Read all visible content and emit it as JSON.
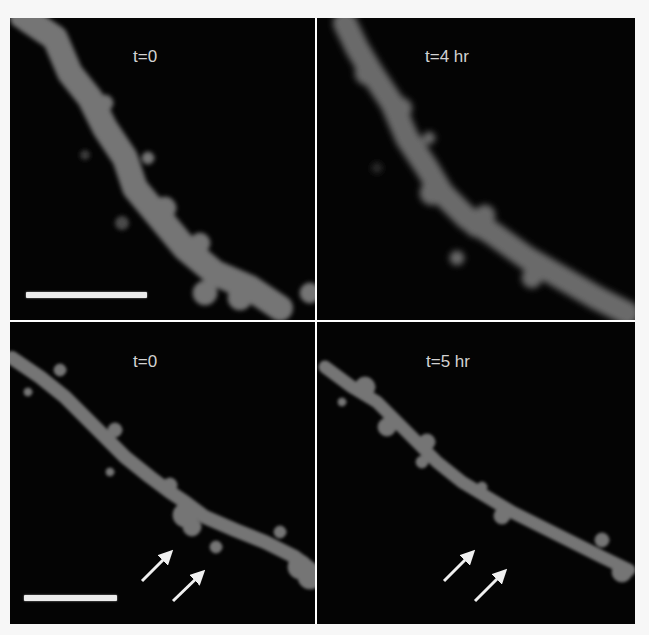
{
  "figure": {
    "caption_fragment": "",
    "panels": [
      {
        "id": "top-left",
        "label": "t=0",
        "scale_bar": true,
        "arrows": 0
      },
      {
        "id": "top-right",
        "label": "t=4 hr",
        "scale_bar": false,
        "arrows": 0
      },
      {
        "id": "bottom-left",
        "label": "t=0",
        "scale_bar": true,
        "arrows": 2
      },
      {
        "id": "bottom-right",
        "label": "t=5 hr",
        "scale_bar": false,
        "arrows": 2
      }
    ],
    "colors": {
      "background": "#040404",
      "dendrite": "#737373",
      "label": "#d2d2d2",
      "scale_bar": "#ececec",
      "arrow": "#f0f0f0",
      "divider": "#ffffff"
    }
  }
}
